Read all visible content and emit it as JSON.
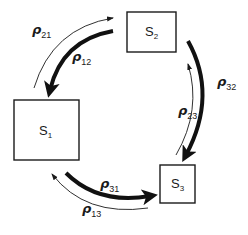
{
  "diagram": {
    "states": [
      {
        "id": "S1",
        "label": "S",
        "sub": "1"
      },
      {
        "id": "S2",
        "label": "S",
        "sub": "2"
      },
      {
        "id": "S3",
        "label": "S",
        "sub": "3"
      }
    ],
    "transitions": [
      {
        "from": "S1",
        "to": "S2",
        "symbol": "ρ",
        "sub": "21",
        "weight": "thin"
      },
      {
        "from": "S2",
        "to": "S1",
        "symbol": "ρ",
        "sub": "12",
        "weight": "thick"
      },
      {
        "from": "S2",
        "to": "S3",
        "symbol": "ρ",
        "sub": "32",
        "weight": "thick"
      },
      {
        "from": "S3",
        "to": "S2",
        "symbol": "ρ",
        "sub": "23",
        "weight": "thin"
      },
      {
        "from": "S1",
        "to": "S3",
        "symbol": "ρ",
        "sub": "31",
        "weight": "thick"
      },
      {
        "from": "S3",
        "to": "S1",
        "symbol": "ρ",
        "sub": "13",
        "weight": "thin"
      }
    ]
  }
}
